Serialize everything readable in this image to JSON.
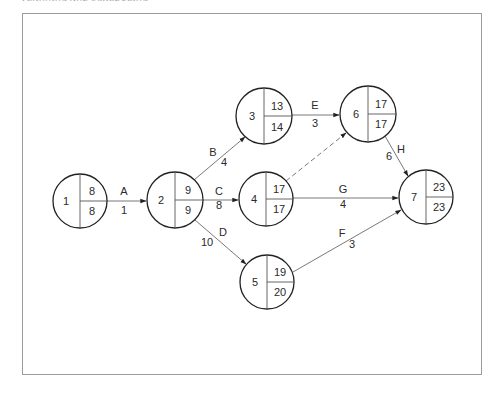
{
  "header": {
    "running_head": "PLANNING AND SCHEDULING"
  },
  "colors": {
    "node_stroke": "#222222",
    "edge_stroke": "#6a6a6a",
    "frame_stroke": "#9b9b9b",
    "text": "#2a2a2a"
  },
  "nodes": [
    {
      "id": "1",
      "cx": 80,
      "cy": 201,
      "r": 27,
      "earliest": "8",
      "latest": "8"
    },
    {
      "id": "2",
      "cx": 175,
      "cy": 200,
      "r": 28,
      "earliest": "9",
      "latest": "9"
    },
    {
      "id": "3",
      "cx": 264,
      "cy": 116,
      "r": 28,
      "earliest": "13",
      "latest": "14"
    },
    {
      "id": "4",
      "cx": 266,
      "cy": 199,
      "r": 27,
      "earliest": "17",
      "latest": "17"
    },
    {
      "id": "5",
      "cx": 267,
      "cy": 282,
      "r": 27,
      "earliest": "19",
      "latest": "20"
    },
    {
      "id": "6",
      "cx": 368,
      "cy": 114,
      "r": 28,
      "earliest": "17",
      "latest": "17"
    },
    {
      "id": "7",
      "cx": 426,
      "cy": 197,
      "r": 27,
      "earliest": "23",
      "latest": "23"
    }
  ],
  "activities": [
    {
      "label": "A",
      "duration": "1",
      "from": "1",
      "to": "2",
      "dashed": false
    },
    {
      "label": "B",
      "duration": "4",
      "from": "2",
      "to": "3",
      "dashed": false
    },
    {
      "label": "C",
      "duration": "8",
      "from": "2",
      "to": "4",
      "dashed": false
    },
    {
      "label": "D",
      "duration": "10",
      "from": "2",
      "to": "5",
      "dashed": false
    },
    {
      "label": "E",
      "duration": "3",
      "from": "3",
      "to": "6",
      "dashed": false
    },
    {
      "label": "",
      "duration": "",
      "from": "4",
      "to": "6",
      "dashed": true
    },
    {
      "label": "G",
      "duration": "4",
      "from": "4",
      "to": "7",
      "dashed": false
    },
    {
      "label": "F",
      "duration": "3",
      "from": "5",
      "to": "7",
      "dashed": false
    },
    {
      "label": "H",
      "duration": "6",
      "from": "6",
      "to": "7",
      "dashed": false
    }
  ],
  "labels": {
    "A": {
      "name": "A",
      "dur": "1"
    },
    "B": {
      "name": "B",
      "dur": "4"
    },
    "C": {
      "name": "C",
      "dur": "8"
    },
    "D": {
      "name": "D",
      "dur": "10"
    },
    "E": {
      "name": "E",
      "dur": "3"
    },
    "F": {
      "name": "F",
      "dur": "3"
    },
    "G": {
      "name": "G",
      "dur": "4"
    },
    "H": {
      "name": "H",
      "dur": "6"
    }
  },
  "node_text": {
    "n1": {
      "id": "1",
      "top": "8",
      "bottom": "8"
    },
    "n2": {
      "id": "2",
      "top": "9",
      "bottom": "9"
    },
    "n3": {
      "id": "3",
      "top": "13",
      "bottom": "14"
    },
    "n4": {
      "id": "4",
      "top": "17",
      "bottom": "17"
    },
    "n5": {
      "id": "5",
      "top": "19",
      "bottom": "20"
    },
    "n6": {
      "id": "6",
      "top": "17",
      "bottom": "17"
    },
    "n7": {
      "id": "7",
      "top": "23",
      "bottom": "23"
    }
  }
}
